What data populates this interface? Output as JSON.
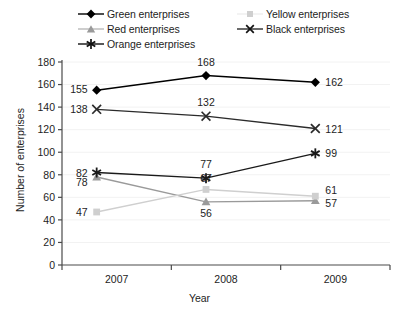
{
  "chart_data": {
    "type": "line",
    "title": "",
    "xlabel": "Year",
    "ylabel": "Number of enterprises",
    "categories": [
      "2007",
      "2008",
      "2009"
    ],
    "ylim": [
      0,
      180
    ],
    "yticks": [
      0,
      20,
      40,
      60,
      80,
      100,
      120,
      140,
      160,
      180
    ],
    "grid": true,
    "legend_position": "top",
    "series": [
      {
        "name": "Green enterprises",
        "marker": "diamond",
        "color": "#000000",
        "values": [
          155,
          168,
          162
        ]
      },
      {
        "name": "Red enterprises",
        "marker": "triangle",
        "color": "#9a9a9a",
        "values": [
          78,
          56,
          57
        ]
      },
      {
        "name": "Orange enterprises",
        "marker": "asterisk",
        "color": "#1a1a1a",
        "values": [
          82,
          77,
          99
        ]
      },
      {
        "name": "Yellow enterprises",
        "marker": "square",
        "color": "#cfcfcf",
        "values": [
          47,
          67,
          61
        ]
      },
      {
        "name": "Black enterprises",
        "marker": "cross-x",
        "color": "#2b2b2b",
        "values": [
          138,
          132,
          121
        ]
      }
    ]
  },
  "legend": {
    "items": [
      {
        "label": "Green enterprises",
        "icon": "diamond-marker-icon"
      },
      {
        "label": "Red enterprises",
        "icon": "triangle-marker-icon"
      },
      {
        "label": "Orange enterprises",
        "icon": "asterisk-marker-icon"
      },
      {
        "label": "Yellow enterprises",
        "icon": "square-marker-icon"
      },
      {
        "label": "Black enterprises",
        "icon": "x-marker-icon"
      }
    ]
  },
  "axes": {
    "x_title": "Year",
    "y_title": "Number of enterprises",
    "x_tick_labels": [
      "2007",
      "2008",
      "2009"
    ],
    "y_tick_labels": [
      "180",
      "160",
      "140",
      "120",
      "100",
      "80",
      "60",
      "40",
      "20",
      "0"
    ]
  },
  "colors": {
    "axis": "#4a4a4a",
    "grid": "#f2f2f2",
    "text": "#1d1d1d",
    "green_series": "#000000",
    "red_series": "#9a9a9a",
    "orange_series": "#1a1a1a",
    "yellow_series": "#cfcfcf",
    "black_series": "#2b2b2b"
  }
}
